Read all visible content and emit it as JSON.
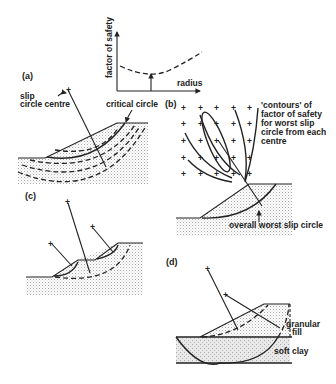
{
  "figure": {
    "panels": [
      {
        "id": "a",
        "label": "(a)"
      },
      {
        "id": "b",
        "label": "(b)"
      },
      {
        "id": "c",
        "label": "(c)"
      },
      {
        "id": "d",
        "label": "(d)"
      }
    ],
    "graph": {
      "ylabel": "factor of safety",
      "xlabel": "radius"
    },
    "annotations": {
      "slip_centre_1": "slip",
      "slip_centre_2": "circle centre",
      "critical_circle": "critical circle",
      "contours_1": "'contours' of",
      "contours_2": "factor of safety",
      "contours_3": "for worst slip",
      "contours_4": "circle from each",
      "contours_5": "centre",
      "overall_worst": "overall worst slip circle",
      "granular_1": "granular",
      "granular_2": "fill",
      "soft_clay": "soft clay"
    },
    "colors": {
      "ink": "#222222",
      "stipple": "#b8b8b8",
      "background": "#ffffff"
    }
  }
}
